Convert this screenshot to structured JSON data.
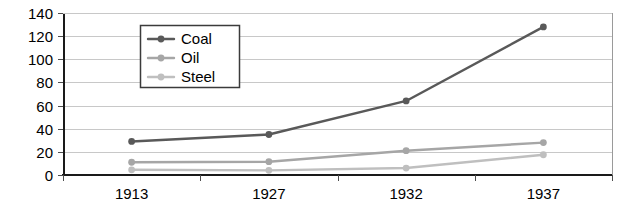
{
  "chart_data": {
    "type": "line",
    "title": "",
    "xlabel": "",
    "ylabel": "",
    "categories": [
      "1913",
      "1927",
      "1932",
      "1937"
    ],
    "series": [
      {
        "name": "Coal",
        "values": [
          29,
          35,
          64,
          128
        ],
        "color": "#595959"
      },
      {
        "name": "Oil",
        "values": [
          11,
          11.5,
          21,
          28
        ],
        "color": "#a6a6a6"
      },
      {
        "name": "Steel",
        "values": [
          4.5,
          4,
          6,
          17.5
        ],
        "color": "#bfbfbf"
      }
    ],
    "ylim": [
      0,
      140
    ],
    "ytick_step": 20,
    "yticks": [
      "0",
      "20",
      "40",
      "60",
      "80",
      "100",
      "120",
      "140"
    ],
    "grid": true,
    "grid_axis": "y",
    "legend": {
      "position": "inside-top-left",
      "entries": [
        "Coal",
        "Oil",
        "Steel"
      ]
    },
    "markers": "circle",
    "background": "#ffffff",
    "gridline_color": "#c8c8c8",
    "axis_color": "#1a1a1a"
  }
}
